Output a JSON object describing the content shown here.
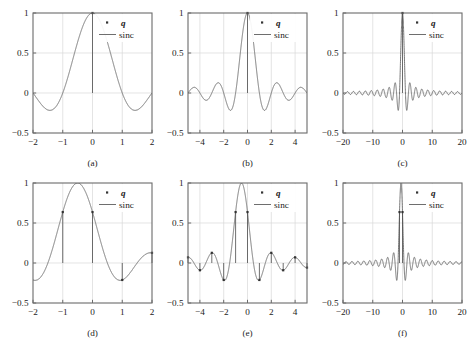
{
  "figure": {
    "layout": "2 rows x 3 columns",
    "background_color": "#ffffff",
    "axis_color": "#6b6b6b",
    "grid_color": "#d8d8d8",
    "curve_color": "#5e5e5e",
    "stem_color": "#4a4a4a",
    "marker_color": "#333333"
  },
  "legend": {
    "marker_label": "q",
    "line_label": "sinc"
  },
  "captions": {
    "a": "(a)",
    "b": "(b)",
    "c": "(c)",
    "d": "(d)",
    "e": "(e)",
    "f": "(f)"
  },
  "chart_data": [
    {
      "id": "a",
      "type": "line",
      "title": "",
      "caption": "(a)",
      "xlabel": "",
      "ylabel": "",
      "xlim": [
        -2,
        2
      ],
      "ylim": [
        -0.5,
        1
      ],
      "xticks": [
        -2,
        -1,
        0,
        1,
        2
      ],
      "xticklabels": [
        "-2",
        "-1",
        "0",
        "1",
        "2"
      ],
      "yticks": [
        -0.5,
        0,
        0.5,
        1
      ],
      "yticklabels": [
        "-0.5",
        "0",
        "0.5",
        "1"
      ],
      "grid": true,
      "legend": [
        "q",
        "sinc"
      ],
      "legend_position": "upper right",
      "function": "sinc(x) = sin(pi*x)/(pi*x)",
      "shift": 0,
      "samples_x": [
        -2,
        -1,
        0,
        1,
        2
      ],
      "samples_y": [
        0,
        0,
        1,
        0,
        0
      ],
      "stem_x": [
        0
      ],
      "stem_y": [
        1
      ]
    },
    {
      "id": "b",
      "type": "line",
      "title": "",
      "caption": "(b)",
      "xlabel": "",
      "ylabel": "",
      "xlim": [
        -5,
        5
      ],
      "ylim": [
        -0.5,
        1
      ],
      "xticks": [
        -4,
        -2,
        0,
        2,
        4
      ],
      "xticklabels": [
        "-4",
        "-2",
        "0",
        "2",
        "4"
      ],
      "yticks": [
        -0.5,
        0,
        0.5,
        1
      ],
      "yticklabels": [
        "-0.5",
        "0",
        "0.5",
        "1"
      ],
      "grid": true,
      "legend": [
        "q",
        "sinc"
      ],
      "legend_position": "upper right",
      "function": "sinc(x) = sin(pi*x)/(pi*x)",
      "shift": 0,
      "samples_x": [
        -5,
        -4,
        -3,
        -2,
        -1,
        0,
        1,
        2,
        3,
        4,
        5
      ],
      "samples_y": [
        0,
        0,
        0,
        0,
        0,
        1,
        0,
        0,
        0,
        0,
        0
      ],
      "stem_x": [
        0
      ],
      "stem_y": [
        1
      ]
    },
    {
      "id": "c",
      "type": "line",
      "title": "",
      "caption": "(c)",
      "xlabel": "",
      "ylabel": "",
      "xlim": [
        -20,
        20
      ],
      "ylim": [
        -0.5,
        1
      ],
      "xticks": [
        -20,
        -10,
        0,
        10,
        20
      ],
      "xticklabels": [
        "-20",
        "-10",
        "0",
        "10",
        "20"
      ],
      "yticks": [
        -0.5,
        0,
        0.5,
        1
      ],
      "yticklabels": [
        "-0.5",
        "0",
        "0.5",
        "1"
      ],
      "grid": true,
      "legend": [
        "q",
        "sinc"
      ],
      "legend_position": "upper right",
      "function": "sinc(x) = sin(pi*x)/(pi*x)",
      "shift": 0,
      "samples_x": [
        -20,
        -15,
        -10,
        -5,
        0,
        5,
        10,
        15,
        20
      ],
      "samples_y": [
        0,
        0,
        0,
        0,
        1,
        0,
        0,
        0,
        0
      ],
      "stem_x": [
        0
      ],
      "stem_y": [
        1
      ]
    },
    {
      "id": "d",
      "type": "line",
      "title": "",
      "caption": "(d)",
      "xlabel": "",
      "ylabel": "",
      "xlim": [
        -2,
        2
      ],
      "ylim": [
        -0.5,
        1
      ],
      "xticks": [
        -2,
        -1,
        0,
        1,
        2
      ],
      "xticklabels": [
        "-2",
        "-1",
        "0",
        "1",
        "2"
      ],
      "yticks": [
        -0.5,
        0,
        0.5,
        1
      ],
      "yticklabels": [
        "-0.5",
        "0",
        "0.5",
        "1"
      ],
      "grid": true,
      "legend": [
        "q",
        "sinc"
      ],
      "legend_position": "upper right",
      "function": "sinc(x + 0.5) = sin(pi*(x+0.5))/(pi*(x+0.5))",
      "shift": -0.5,
      "samples_x": [
        -2,
        -1,
        0,
        1,
        2
      ],
      "samples_y": [
        -0.2122,
        0.6366,
        0.6366,
        -0.2122,
        0.1273
      ],
      "stem_x": [
        -1,
        0,
        1,
        2
      ],
      "stem_y": [
        0.6366,
        0.6366,
        -0.2122,
        0.1273
      ]
    },
    {
      "id": "e",
      "type": "line",
      "title": "",
      "caption": "(e)",
      "xlabel": "",
      "ylabel": "",
      "xlim": [
        -5,
        5
      ],
      "ylim": [
        -0.5,
        1
      ],
      "xticks": [
        -4,
        -2,
        0,
        2,
        4
      ],
      "xticklabels": [
        "-4",
        "-2",
        "0",
        "2",
        "4"
      ],
      "yticks": [
        -0.5,
        0,
        0.5,
        1
      ],
      "yticklabels": [
        "-0.5",
        "0",
        "0.5",
        "1"
      ],
      "grid": true,
      "legend": [
        "q",
        "sinc"
      ],
      "legend_position": "upper right",
      "function": "sinc(x + 0.5) = sin(pi*(x+0.5))/(pi*(x+0.5))",
      "shift": -0.5,
      "samples_x": [
        -5,
        -4,
        -3,
        -2,
        -1,
        0,
        1,
        2,
        3,
        4,
        5
      ],
      "samples_y": [
        0.0707,
        -0.0909,
        0.1273,
        -0.2122,
        0.6366,
        0.6366,
        -0.2122,
        0.1273,
        -0.0909,
        0.0707,
        -0.0578
      ],
      "stem_x": [
        -5,
        -4,
        -3,
        -2,
        -1,
        0,
        1,
        2,
        3,
        4,
        5
      ],
      "stem_y": [
        0.0707,
        -0.0909,
        0.1273,
        -0.2122,
        0.6366,
        0.6366,
        -0.2122,
        0.1273,
        -0.0909,
        0.0707,
        -0.0578
      ]
    },
    {
      "id": "f",
      "type": "line",
      "title": "",
      "caption": "(f)",
      "xlabel": "",
      "ylabel": "",
      "xlim": [
        -20,
        20
      ],
      "ylim": [
        -0.5,
        1
      ],
      "xticks": [
        -20,
        -10,
        0,
        10,
        20
      ],
      "xticklabels": [
        "-20",
        "-10",
        "0",
        "10",
        "20"
      ],
      "yticks": [
        -0.5,
        0,
        0.5,
        1
      ],
      "yticklabels": [
        "-0.5",
        "0",
        "0.5",
        "1"
      ],
      "grid": true,
      "legend": [
        "q",
        "sinc"
      ],
      "legend_position": "upper right",
      "function": "sinc(x + 0.5) = sin(pi*(x+0.5))/(pi*(x+0.5))",
      "shift": -0.5,
      "samples_x": [
        -20,
        -15,
        -10,
        -5,
        0,
        5,
        10,
        15,
        20
      ],
      "samples_y": [
        -0.0163,
        0.0219,
        0.0335,
        0.0707,
        0.6366,
        -0.0578,
        0.0303,
        -0.0205,
        0.0157
      ],
      "stem_x": [
        -1,
        0
      ],
      "stem_y": [
        0.6366,
        0.6366
      ]
    }
  ]
}
